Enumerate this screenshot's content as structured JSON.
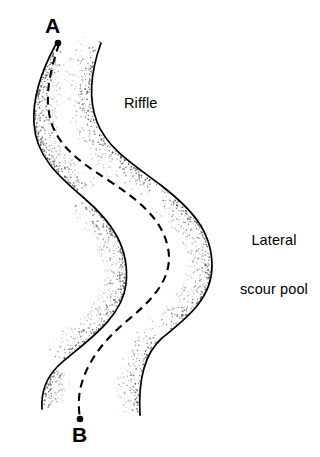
{
  "figure": {
    "background_color": "#ffffff",
    "line_color": "#000000",
    "stipple_color": "#555555",
    "width": 320,
    "height": 457
  },
  "labels": {
    "riffle": "Riffle",
    "lateral_scour_pool_line1": "Lateral",
    "lateral_scour_pool_line2": "scour pool",
    "point_a": "A",
    "point_b": "B"
  },
  "annotations": [
    {
      "name": "riffle",
      "text": "Riffle",
      "x": 124,
      "y": 95
    },
    {
      "name": "lateral-scour-pool",
      "text": "Lateral scour pool",
      "x": 240,
      "y": 200
    },
    {
      "name": "point-a",
      "text": "A",
      "x": 45,
      "y": 14
    },
    {
      "name": "point-b",
      "text": "B",
      "x": 72,
      "y": 423
    }
  ],
  "geometry": {
    "left_bank_path": "M 56 44 C 44 66, 32 94, 34 124 C 36 156, 58 176, 84 198 C 112 222, 130 248, 126 284 C 122 320, 82 344, 58 366 C 44 380, 41 394, 42 409",
    "right_bank_path": "M 101 43 C 92 68, 87 96, 97 122 C 108 150, 136 166, 162 186 C 190 208, 212 230, 212 266 C 212 300, 184 320, 162 338 C 144 354, 138 380, 140 415",
    "thalweg_path": "M 59 44 C 52 66, 44 92, 50 118 C 57 146, 80 162, 108 180 C 138 200, 162 218, 168 248 C 174 278, 152 300, 128 320 C 104 340, 86 362, 80 390 C 78 402, 79 412, 80 419",
    "point_a_dot": {
      "cx": 58,
      "cy": 43,
      "r": 3.3
    },
    "point_b_dot": {
      "cx": 80,
      "cy": 419,
      "r": 3.3
    }
  },
  "stipple_bands": [
    {
      "name": "upper-left-outer-bend",
      "path": "M 56 44 C 44 66, 32 94, 34 124 C 36 156, 58 176, 84 198",
      "side": -1,
      "width": 22,
      "density": 0.62
    },
    {
      "name": "upper-right-outer-bend",
      "path": "M 101 43 C 92 68, 87 96, 97 122 C 108 150, 136 166, 162 186",
      "side": 1,
      "width": 24,
      "density": 0.58
    },
    {
      "name": "mid-left-inner-bar",
      "path": "M 84 198 C 112 222, 130 248, 126 284 C 122 320, 82 344, 58 366",
      "side": 1,
      "width": 22,
      "density": 0.55
    },
    {
      "name": "mid-right-outer-bend",
      "path": "M 162 186 C 190 208, 212 230, 212 266 C 212 300, 184 320, 162 338",
      "side": 1,
      "width": 24,
      "density": 0.6
    },
    {
      "name": "lower-left-bank",
      "path": "M 58 366 C 44 380, 41 394, 42 409",
      "side": -1,
      "width": 20,
      "density": 0.5
    },
    {
      "name": "lower-right-bank",
      "path": "M 162 338 C 144 354, 138 380, 140 415",
      "side": 1,
      "width": 22,
      "density": 0.55
    }
  ],
  "legend_meaning": {
    "solid_lines": "stream bank",
    "dashed_line": "thalweg / deepest flow path from A to B",
    "stipple": "gravel / sediment deposit"
  }
}
